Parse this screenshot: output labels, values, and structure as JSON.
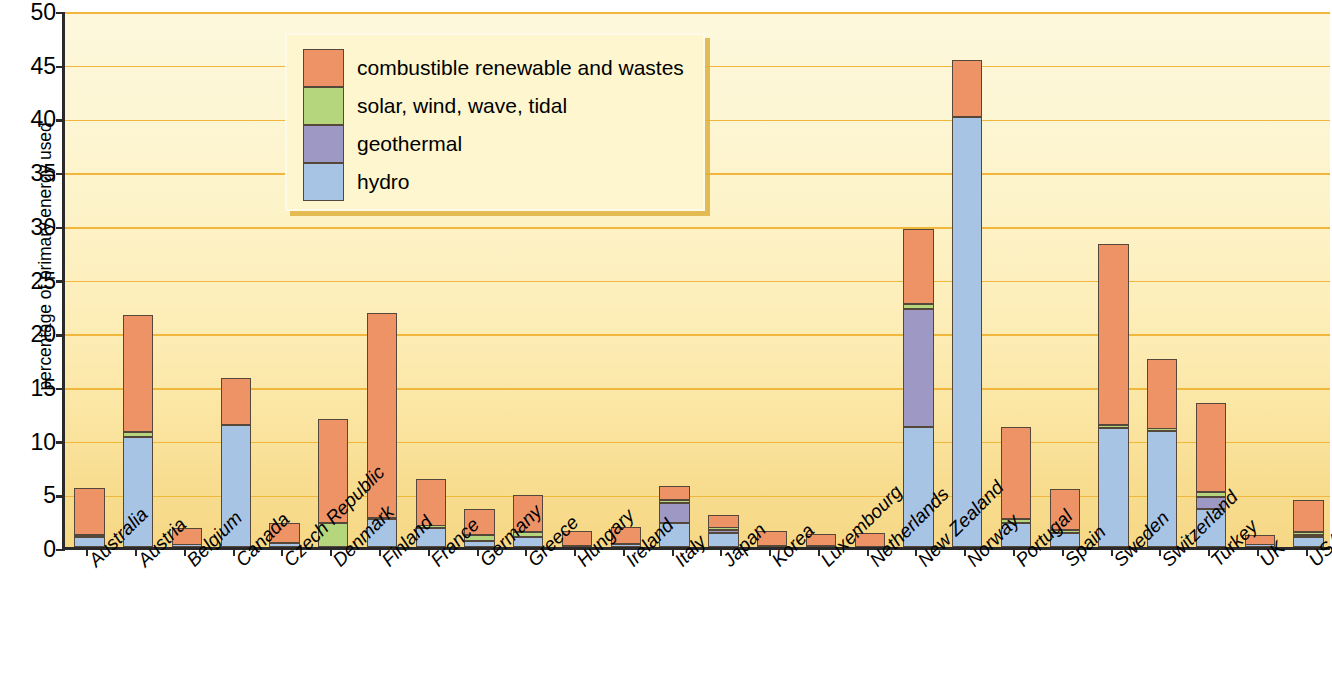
{
  "chart_data": {
    "type": "bar",
    "stacked": true,
    "title": "",
    "xlabel": "",
    "ylabel": "percentage of primary energy used",
    "ylim": [
      0,
      50
    ],
    "ytick_labels": [
      "0",
      "5",
      "10",
      "15",
      "20",
      "25",
      "30",
      "35",
      "40",
      "45",
      "50"
    ],
    "ytick_values": [
      0,
      5,
      10,
      15,
      20,
      25,
      30,
      35,
      40,
      45,
      50
    ],
    "grid": true,
    "legend_position": "upper-left-inset",
    "legend_entries": [
      "combustible renewable and wastes",
      "solar, wind, wave, tidal",
      "geothermal",
      "hydro"
    ],
    "series_colors": {
      "combustible renewable and wastes": "#ee9366",
      "solar, wind, wave, tidal": "#b5d67c",
      "geothermal": "#9e98c4",
      "hydro": "#a8c4e4"
    },
    "stack_order_bottom_to_top": [
      "hydro",
      "geothermal",
      "solar, wind, wave, tidal",
      "combustible renewable and wastes"
    ],
    "categories": [
      "Australia",
      "Austria",
      "Belgium",
      "Canada",
      "Czech Republic",
      "Denmark",
      "Finland",
      "France",
      "Germany",
      "Greece",
      "Hungary",
      "Ireland",
      "Italy",
      "Japan",
      "Korea",
      "Luxembourg",
      "Netherlands",
      "New Zealand",
      "Norway",
      "Portugal",
      "Spain",
      "Sweden",
      "Switzerland",
      "Turkey",
      "UK",
      "USA"
    ],
    "series": [
      {
        "name": "hydro",
        "values": [
          0.9,
          10.2,
          0.2,
          11.4,
          0.4,
          0.0,
          2.6,
          1.8,
          0.6,
          0.9,
          0.1,
          0.2,
          2.2,
          1.3,
          0.1,
          0.1,
          0.0,
          11.2,
          40.0,
          2.2,
          1.3,
          11.1,
          10.8,
          3.5,
          0.2,
          0.9
        ]
      },
      {
        "name": "geothermal",
        "values": [
          0.0,
          0.0,
          0.0,
          0.0,
          0.0,
          0.0,
          0.0,
          0.0,
          0.0,
          0.0,
          0.0,
          0.0,
          1.9,
          0.3,
          0.0,
          0.0,
          0.0,
          11.0,
          0.0,
          0.0,
          0.0,
          0.0,
          0.0,
          1.2,
          0.0,
          0.2
        ]
      },
      {
        "name": "solar, wind, wave, tidal",
        "values": [
          0.2,
          0.5,
          0.0,
          0.0,
          0.0,
          2.2,
          0.1,
          0.2,
          0.5,
          0.5,
          0.0,
          0.1,
          0.3,
          0.2,
          0.0,
          0.0,
          0.0,
          0.4,
          0.0,
          0.4,
          0.3,
          0.3,
          0.2,
          0.4,
          0.0,
          0.3
        ]
      },
      {
        "name": "combustible renewable and wastes",
        "values": [
          4.4,
          10.9,
          1.6,
          4.3,
          1.8,
          9.7,
          19.1,
          4.3,
          2.4,
          3.4,
          1.4,
          1.6,
          1.3,
          1.2,
          1.4,
          1.1,
          1.3,
          7.0,
          5.3,
          8.6,
          3.8,
          16.8,
          6.5,
          8.3,
          0.9,
          3.0
        ]
      }
    ],
    "totals": [
      5.5,
      21.6,
      1.8,
      15.7,
      2.2,
      11.9,
      21.8,
      6.3,
      3.5,
      4.8,
      1.5,
      1.9,
      5.7,
      3.0,
      1.5,
      1.2,
      1.3,
      29.6,
      45.3,
      11.2,
      5.4,
      28.2,
      17.5,
      13.4,
      1.1,
      4.4
    ]
  },
  "axis": {
    "y_title": "percentage of primary energy used"
  }
}
